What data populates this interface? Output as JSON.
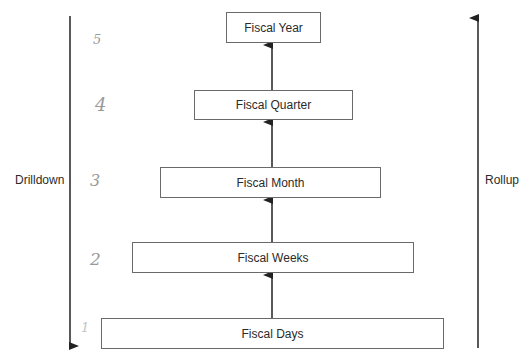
{
  "diagram": {
    "type": "hierarchy",
    "levels": [
      {
        "label": "Fiscal Year",
        "number": "5"
      },
      {
        "label": "Fiscal Quarter",
        "number": "4"
      },
      {
        "label": "Fiscal Month",
        "number": "3"
      },
      {
        "label": "Fiscal Weeks",
        "number": "2"
      },
      {
        "label": "Fiscal Days",
        "number": "1"
      }
    ],
    "left_axis": {
      "label": "Drilldown",
      "direction": "down"
    },
    "right_axis": {
      "label": "Rollup",
      "direction": "up"
    },
    "colors": {
      "line": "#222222",
      "box_border": "#6a6a6a",
      "handwriting": "#9a9a9a"
    }
  }
}
